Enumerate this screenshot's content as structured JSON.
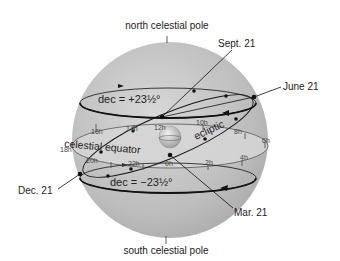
{
  "labels": {
    "north_pole": "north celestial pole",
    "south_pole": "south celestial pole",
    "sept21": "Sept. 21",
    "june21": "June 21",
    "dec21": "Dec. 21",
    "mar21": "Mar. 21",
    "dec_north": "dec = +23½°",
    "dec_south": "dec = −23½°",
    "celestial_equator": "celestial equator",
    "ecliptic": "ecliptic"
  },
  "hour_marks": {
    "h16": "16h",
    "h14": "14h",
    "h12": "12h",
    "h10": "10h",
    "h8": "8h",
    "h6": "6h",
    "h18": "18h",
    "h20": "20h",
    "h22": "22h",
    "h0": "0h",
    "h2": "2h",
    "h4": "4h"
  },
  "colors": {
    "sphere": "#b9b9b9",
    "equator_band": "#cfcfcf",
    "line": "#111111"
  }
}
